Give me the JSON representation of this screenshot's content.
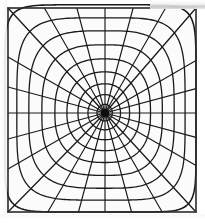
{
  "figure": {
    "title": "Polar coordinate grid with square outer boundary",
    "kind": "line-diagram",
    "caption": "",
    "canvas": {
      "width": 205,
      "height": 223
    },
    "colors": {
      "background": "#ffffff",
      "plot_background": "#fbfbfb",
      "line": "#1a1a1a",
      "frame": "#2b2b2b",
      "center_blob": "#0d0d0d",
      "scan_artifact": "#c9c9c9"
    }
  },
  "frame": {
    "label": "outer-square-boundary",
    "left": 8,
    "top": 8,
    "right": 196,
    "bottom": 212,
    "stroke_width": 1.6
  },
  "center": {
    "label": "convergence-point",
    "x": 105,
    "y": 113,
    "blob_radius": 4.2
  },
  "chart_data": {
    "type": "line",
    "title": "Polar coordinate grid with square outer boundary",
    "xlabel": "",
    "ylabel": "",
    "grid": true,
    "legend": false,
    "spokes": {
      "count": 24,
      "angle_step_deg": 15,
      "angles_deg": [
        0,
        15,
        30,
        45,
        60,
        75,
        90,
        105,
        120,
        135,
        150,
        165,
        180,
        195,
        210,
        225,
        240,
        255,
        270,
        285,
        300,
        315,
        330,
        345
      ],
      "diagonal_angles_deg": [
        45,
        135,
        225,
        315
      ],
      "note": "radial lines run from the center point outward to the square boundary"
    },
    "rings": {
      "count": 9,
      "radii_fraction": [
        0.08,
        0.17,
        0.27,
        0.38,
        0.5,
        0.63,
        0.76,
        0.88,
        1.0
      ],
      "squareness_exponent": [
        2.0,
        2.05,
        2.15,
        2.3,
        2.55,
        2.9,
        3.4,
        4.4,
        8.0
      ],
      "note": "rings morph from circles near the center to a rounded square at the boundary"
    }
  },
  "annotations": {
    "items": []
  }
}
